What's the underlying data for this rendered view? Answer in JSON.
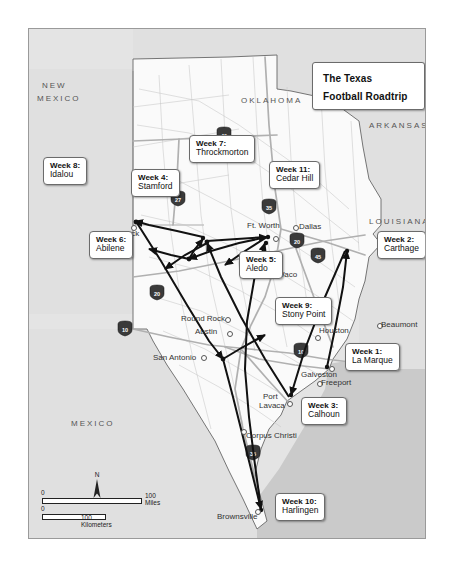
{
  "title": "The Texas Football Roadtrip",
  "states": [
    {
      "name": "NEW MEXICO",
      "line1": "NEW",
      "line2": "MEXICO"
    },
    {
      "name": "OKLAHOMA",
      "line1": "OKLAHOMA",
      "line2": ""
    },
    {
      "name": "ARKANSAS",
      "line1": "ARKANSAS",
      "line2": ""
    },
    {
      "name": "LOUISIANA",
      "line1": "LOUISIANA",
      "line2": ""
    },
    {
      "name": "MEXICO",
      "line1": "MEXICO",
      "line2": ""
    }
  ],
  "state_labels": {
    "new_mexico_1": "NEW",
    "new_mexico_2": "MEXICO",
    "oklahoma": "OKLAHOMA",
    "arkansas": "ARKANSAS",
    "louisiana": "LOUISIANA",
    "mexico": "MEXICO"
  },
  "cities": [
    {
      "name": "Lubbock"
    },
    {
      "name": "Ft. Worth"
    },
    {
      "name": "Dallas"
    },
    {
      "name": "Waco"
    },
    {
      "name": "Round Rock"
    },
    {
      "name": "Austin"
    },
    {
      "name": "San Antonio"
    },
    {
      "name": "Houston"
    },
    {
      "name": "Beaumont"
    },
    {
      "name": "Galveston"
    },
    {
      "name": "Freeport"
    },
    {
      "name": "Port Lavaca"
    },
    {
      "name": "Corpus Christi"
    },
    {
      "name": "Brownsville"
    }
  ],
  "city_labels": {
    "lubbock": "Lubbock",
    "ft_worth": "Ft. Worth",
    "dallas": "Dallas",
    "waco": "Waco",
    "round_rock": "Round Rock",
    "austin": "Austin",
    "san_antonio": "San Antonio",
    "houston": "Houston",
    "beaumont": "Beaumont",
    "galveston": "Galveston",
    "freeport": "Freeport",
    "port_lavaca_1": "Port",
    "port_lavaca_2": "Lavaca",
    "corpus_christi": "Corpus Christi",
    "brownsville": "Brownsville"
  },
  "stops": [
    {
      "week": "Week 1:",
      "place": "La Marque"
    },
    {
      "week": "Week 2:",
      "place": "Carthage"
    },
    {
      "week": "Week 3:",
      "place": "Calhoun"
    },
    {
      "week": "Week 4:",
      "place": "Stamford"
    },
    {
      "week": "Week 5:",
      "place": "Aledo"
    },
    {
      "week": "Week 6:",
      "place": "Abilene"
    },
    {
      "week": "Week 7:",
      "place": "Throckmorton"
    },
    {
      "week": "Week 8:",
      "place": "Idalou"
    },
    {
      "week": "Week 9:",
      "place": "Stony Point"
    },
    {
      "week": "Week 10:",
      "place": "Harlingen"
    },
    {
      "week": "Week 11:",
      "place": "Cedar Hill"
    }
  ],
  "highways": [
    {
      "label": "40"
    },
    {
      "label": "27"
    },
    {
      "label": "35"
    },
    {
      "label": "20"
    },
    {
      "label": "20"
    },
    {
      "label": "45"
    },
    {
      "label": "10"
    },
    {
      "label": "10"
    },
    {
      "label": "35"
    }
  ],
  "highway_shields": {
    "i40": "40",
    "i27": "27",
    "i35_north": "35",
    "i20_west": "20",
    "i20_east": "20",
    "i45": "45",
    "i10_west": "10",
    "i10_east": "10",
    "i35_south": "35"
  },
  "scale": {
    "miles_zero": "0",
    "miles_label": "100 Miles",
    "km_zero": "0",
    "km_label": "100 Kilometers"
  },
  "compass": {
    "north": "N"
  },
  "colors": {
    "land": "#f7f7f7",
    "neighbor": "#dcdcdc",
    "water": "#c9c9c9",
    "route": "#1a1a1a",
    "border": "#9a9a9a"
  }
}
